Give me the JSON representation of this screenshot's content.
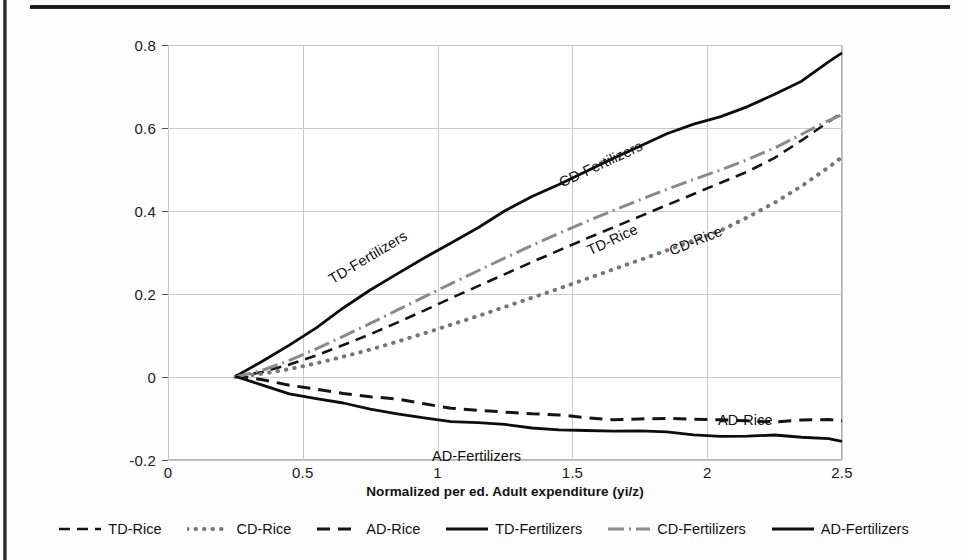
{
  "figure": {
    "background": "#fdfdfd",
    "page_rule_color": "#1c1c1c"
  },
  "chart_data": {
    "type": "line",
    "title": "",
    "subtitle": "",
    "xlabel": "Normalized per ed. Adult expenditure (yi/z)",
    "ylabel": "",
    "xlim": [
      0,
      2.5
    ],
    "ylim": [
      -0.2,
      0.8
    ],
    "xticks": [
      "0",
      "0.5",
      "1",
      "1.5",
      "2",
      "2.5"
    ],
    "xtick_values": [
      0,
      0.5,
      1,
      1.5,
      2,
      2.5
    ],
    "yticks": [
      "0.8",
      "0.6",
      "0.4",
      "0.2",
      "0",
      "-0.2"
    ],
    "ytick_values": [
      0.8,
      0.6,
      0.4,
      0.2,
      0,
      -0.2
    ],
    "grid": true,
    "legend_position": "bottom",
    "x": [
      0.25,
      0.35,
      0.45,
      0.55,
      0.65,
      0.75,
      0.85,
      0.95,
      1.05,
      1.15,
      1.25,
      1.35,
      1.45,
      1.55,
      1.65,
      1.75,
      1.85,
      1.95,
      2.05,
      2.15,
      2.25,
      2.35,
      2.45,
      2.5
    ],
    "series": [
      {
        "name": "TD-Rice",
        "style": "dashed",
        "color": "#141414",
        "width": 2.6,
        "dash": "11,7",
        "values": [
          0.0,
          0.012,
          0.03,
          0.052,
          0.077,
          0.103,
          0.131,
          0.16,
          0.19,
          0.219,
          0.248,
          0.277,
          0.305,
          0.333,
          0.36,
          0.387,
          0.414,
          0.441,
          0.468,
          0.495,
          0.528,
          0.57,
          0.615,
          0.637
        ]
      },
      {
        "name": "CD-Rice",
        "style": "dotted",
        "color": "#767676",
        "width": 4.0,
        "dash": "0.5,8",
        "values": [
          0.0,
          0.008,
          0.019,
          0.033,
          0.049,
          0.066,
          0.085,
          0.105,
          0.126,
          0.147,
          0.169,
          0.191,
          0.213,
          0.236,
          0.259,
          0.282,
          0.305,
          0.329,
          0.353,
          0.385,
          0.42,
          0.46,
          0.505,
          0.53
        ]
      },
      {
        "name": "AD-Rice",
        "style": "dashed",
        "color": "#141414",
        "width": 3.0,
        "dash": "13,8",
        "values": [
          0.0,
          -0.008,
          -0.018,
          -0.028,
          -0.038,
          -0.048,
          -0.057,
          -0.065,
          -0.072,
          -0.079,
          -0.085,
          -0.09,
          -0.094,
          -0.097,
          -0.099,
          -0.101,
          -0.102,
          -0.103,
          -0.104,
          -0.104,
          -0.105,
          -0.105,
          -0.106,
          -0.106
        ]
      },
      {
        "name": "TD-Fertilizers",
        "style": "solid",
        "color": "#0d0d0d",
        "width": 2.8,
        "dash": "none",
        "values": [
          0.0,
          0.036,
          0.079,
          0.122,
          0.165,
          0.207,
          0.248,
          0.287,
          0.325,
          0.362,
          0.398,
          0.432,
          0.465,
          0.497,
          0.528,
          0.557,
          0.583,
          0.607,
          0.63,
          0.654,
          0.681,
          0.712,
          0.757,
          0.78
        ]
      },
      {
        "name": "CD-Fertilizers",
        "style": "dash-dot",
        "color": "#8a8a8a",
        "width": 3.0,
        "dash": "16,5,2,5",
        "values": [
          0.0,
          0.016,
          0.04,
          0.068,
          0.098,
          0.129,
          0.161,
          0.193,
          0.225,
          0.256,
          0.287,
          0.317,
          0.346,
          0.374,
          0.401,
          0.427,
          0.452,
          0.476,
          0.499,
          0.524,
          0.552,
          0.585,
          0.618,
          0.632
        ]
      },
      {
        "name": "AD-Fertilizers",
        "style": "solid",
        "color": "#0d0d0d",
        "width": 2.8,
        "dash": "none",
        "values": [
          0.0,
          -0.018,
          -0.037,
          -0.053,
          -0.066,
          -0.078,
          -0.088,
          -0.097,
          -0.105,
          -0.112,
          -0.118,
          -0.122,
          -0.125,
          -0.128,
          -0.13,
          -0.132,
          -0.135,
          -0.137,
          -0.14,
          -0.143,
          -0.141,
          -0.147,
          -0.15,
          -0.152
        ]
      }
    ],
    "annotations": [
      {
        "text": "TD-Fertilizers",
        "x_px": 330,
        "y_px": 272,
        "rotate": -31
      },
      {
        "text": "CD-Fertilizers",
        "x_px": 560,
        "y_px": 175,
        "rotate": -25
      },
      {
        "text": "TD-Rice",
        "x_px": 588,
        "y_px": 243,
        "rotate": -25
      },
      {
        "text": "CD-Rice",
        "x_px": 670,
        "y_px": 243,
        "rotate": -22
      },
      {
        "text": "AD-Rice",
        "x_px": 718,
        "y_px": 412,
        "rotate": 0
      },
      {
        "text": "AD-Fertilizers",
        "x_px": 432,
        "y_px": 448,
        "rotate": 0
      }
    ]
  }
}
